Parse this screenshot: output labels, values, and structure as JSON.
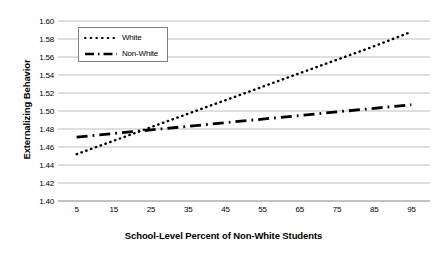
{
  "chart_data": {
    "type": "line",
    "title": "",
    "xlabel": "School-Level Percent of Non-White Students",
    "ylabel": "Externalizing Behavior",
    "xlim": [
      0,
      100
    ],
    "ylim": [
      1.4,
      1.6
    ],
    "xticks": [
      5,
      15,
      25,
      35,
      45,
      55,
      65,
      75,
      85,
      95
    ],
    "yticks": [
      "1.40",
      "1.42",
      "1.44",
      "1.46",
      "1.48",
      "1.50",
      "1.52",
      "1.54",
      "1.56",
      "1.58",
      "1.60"
    ],
    "grid": "horizontal",
    "legend_position": "upper-left-inside",
    "x": [
      5,
      15,
      25,
      35,
      45,
      55,
      65,
      75,
      85,
      95
    ],
    "series": [
      {
        "name": "White",
        "style": "dotted",
        "color": "#000000",
        "values": [
          1.452,
          1.467,
          1.482,
          1.497,
          1.512,
          1.527,
          1.542,
          1.557,
          1.572,
          1.588
        ]
      },
      {
        "name": "Non-White",
        "style": "dash-dot",
        "color": "#000000",
        "values": [
          1.471,
          1.475,
          1.479,
          1.483,
          1.487,
          1.491,
          1.495,
          1.499,
          1.503,
          1.507
        ]
      }
    ]
  },
  "legend": {
    "items": [
      {
        "label": "White"
      },
      {
        "label": "Non-White"
      }
    ]
  },
  "axes": {
    "y_title": "Externalizing Behavior",
    "x_title": "School-Level Percent of Non-White Students"
  }
}
